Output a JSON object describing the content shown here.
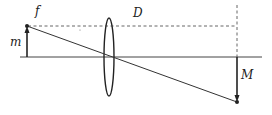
{
  "diagram": {
    "type": "thin-lens-ray-diagram",
    "labels": {
      "focal": "f",
      "distance": "D",
      "object": "m",
      "image": "M"
    },
    "colors": {
      "line": "#333333",
      "dashed": "#555555",
      "background": "#ffffff"
    }
  }
}
